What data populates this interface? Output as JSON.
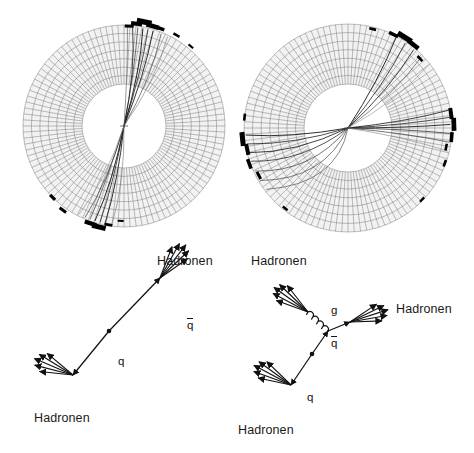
{
  "figure": {
    "type": "particle-physics-event-display",
    "background": "#ffffff",
    "ink": "#111111"
  },
  "detectors": [
    {
      "id": "detector-left",
      "name": "two-jet-event",
      "jet_count": 2,
      "center": [
        124,
        126
      ],
      "inner_radius": 42,
      "outer_radius": 101,
      "ring_cells": 104,
      "ring_rows": 7,
      "grid_color": "#6a6a6a",
      "cell_fill": "#f2f2f2",
      "tracks": [
        {
          "angle_deg": -73,
          "curve": 5,
          "width": 0.9,
          "shade": "#1a1a1a"
        },
        {
          "angle_deg": -76,
          "curve": 4,
          "width": 0.8,
          "shade": "#222222"
        },
        {
          "angle_deg": -79,
          "curve": 6,
          "width": 0.9,
          "shade": "#111111"
        },
        {
          "angle_deg": -82,
          "curve": 3,
          "width": 0.7,
          "shade": "#333333"
        },
        {
          "angle_deg": -85,
          "curve": 7,
          "width": 0.8,
          "shade": "#1a1a1a"
        },
        {
          "angle_deg": -68,
          "curve": 8,
          "width": 0.7,
          "shade": "#444444"
        },
        {
          "angle_deg": -64,
          "curve": 9,
          "width": 0.6,
          "shade": "#777777"
        },
        {
          "angle_deg": -88,
          "curve": 2,
          "width": 0.6,
          "shade": "#555555"
        },
        {
          "angle_deg": 101,
          "curve": -5,
          "width": 0.9,
          "shade": "#1a1a1a"
        },
        {
          "angle_deg": 104,
          "curve": -4,
          "width": 0.8,
          "shade": "#222222"
        },
        {
          "angle_deg": 107,
          "curve": -6,
          "width": 0.9,
          "shade": "#111111"
        },
        {
          "angle_deg": 110,
          "curve": -3,
          "width": 0.7,
          "shade": "#333333"
        },
        {
          "angle_deg": 113,
          "curve": -7,
          "width": 0.7,
          "shade": "#3a3a3a"
        },
        {
          "angle_deg": 97,
          "curve": -8,
          "width": 0.6,
          "shade": "#707070"
        },
        {
          "angle_deg": 117,
          "curve": -9,
          "width": 0.6,
          "shade": "#888888"
        }
      ],
      "deposits": [
        {
          "angle_deg": -74,
          "radius": 104,
          "length": 13,
          "thickness": 4.5
        },
        {
          "angle_deg": -79,
          "radius": 106,
          "length": 15,
          "thickness": 5.5
        },
        {
          "angle_deg": -83,
          "radius": 103,
          "length": 11,
          "thickness": 4.0
        },
        {
          "angle_deg": -70,
          "radius": 104,
          "length": 10,
          "thickness": 3.5
        },
        {
          "angle_deg": -87,
          "radius": 100,
          "length": 9,
          "thickness": 3.0
        },
        {
          "angle_deg": -60,
          "radius": 105,
          "length": 7,
          "thickness": 2.5
        },
        {
          "angle_deg": -50,
          "radius": 104,
          "length": 6,
          "thickness": 2.2
        },
        {
          "angle_deg": 104,
          "radius": 104,
          "length": 14,
          "thickness": 5.0
        },
        {
          "angle_deg": 109,
          "radius": 103,
          "length": 12,
          "thickness": 4.2
        },
        {
          "angle_deg": 99,
          "radius": 100,
          "length": 8,
          "thickness": 3.0
        },
        {
          "angle_deg": 126,
          "radius": 104,
          "length": 8,
          "thickness": 3.0
        },
        {
          "angle_deg": 135,
          "radius": 101,
          "length": 7,
          "thickness": 3.2
        },
        {
          "angle_deg": 92,
          "radius": 95,
          "length": 6,
          "thickness": 2.0
        }
      ]
    },
    {
      "id": "detector-right",
      "name": "three-jet-event",
      "jet_count": 3,
      "center": [
        348,
        128
      ],
      "inner_radius": 44,
      "outer_radius": 104,
      "ring_cells": 104,
      "ring_rows": 7,
      "grid_color": "#6a6a6a",
      "cell_fill": "#f2f2f2",
      "tracks": [
        {
          "angle_deg": -2,
          "curve": 2,
          "width": 0.9,
          "shade": "#1a1a1a"
        },
        {
          "angle_deg": -6,
          "curve": 3,
          "width": 0.8,
          "shade": "#222222"
        },
        {
          "angle_deg": -10,
          "curve": 4,
          "width": 0.8,
          "shade": "#111111"
        },
        {
          "angle_deg": 3,
          "curve": -2,
          "width": 0.8,
          "shade": "#333333"
        },
        {
          "angle_deg": 8,
          "curve": -3,
          "width": 0.7,
          "shade": "#3a3a3a"
        },
        {
          "angle_deg": 13,
          "curve": -4,
          "width": 0.6,
          "shade": "#808080"
        },
        {
          "angle_deg": -62,
          "curve": 5,
          "width": 0.9,
          "shade": "#1a1a1a"
        },
        {
          "angle_deg": -56,
          "curve": 6,
          "width": 0.8,
          "shade": "#222222"
        },
        {
          "angle_deg": -50,
          "curve": 7,
          "width": 0.8,
          "shade": "#111111"
        },
        {
          "angle_deg": -44,
          "curve": 8,
          "width": 0.7,
          "shade": "#555555"
        },
        {
          "angle_deg": -38,
          "curve": 9,
          "width": 0.6,
          "shade": "#909090"
        },
        {
          "angle_deg": 176,
          "curve": -6,
          "width": 0.9,
          "shade": "#1a1a1a"
        },
        {
          "angle_deg": 171,
          "curve": -8,
          "width": 0.8,
          "shade": "#222222"
        },
        {
          "angle_deg": 166,
          "curve": -12,
          "width": 0.8,
          "shade": "#111111"
        },
        {
          "angle_deg": 161,
          "curve": -18,
          "width": 0.8,
          "shade": "#2a2a2a"
        },
        {
          "angle_deg": 155,
          "curve": -26,
          "width": 0.7,
          "shade": "#3a3a3a"
        },
        {
          "angle_deg": 149,
          "curve": -34,
          "width": 0.7,
          "shade": "#444444"
        },
        {
          "angle_deg": 143,
          "curve": -42,
          "width": 0.7,
          "shade": "#555555"
        }
      ],
      "deposits": [
        {
          "angle_deg": -58,
          "radius": 107,
          "length": 16,
          "thickness": 5.5
        },
        {
          "angle_deg": -52,
          "radius": 106,
          "length": 13,
          "thickness": 4.5
        },
        {
          "angle_deg": -64,
          "radius": 104,
          "length": 10,
          "thickness": 3.5
        },
        {
          "angle_deg": -44,
          "radius": 100,
          "length": 7,
          "thickness": 2.6
        },
        {
          "angle_deg": -76,
          "radius": 102,
          "length": 7,
          "thickness": 2.6
        },
        {
          "angle_deg": -2,
          "radius": 106,
          "length": 13,
          "thickness": 4.6
        },
        {
          "angle_deg": -8,
          "radius": 104,
          "length": 11,
          "thickness": 4.0
        },
        {
          "angle_deg": 5,
          "radius": 104,
          "length": 10,
          "thickness": 3.6
        },
        {
          "angle_deg": 11,
          "radius": 100,
          "length": 7,
          "thickness": 2.6
        },
        {
          "angle_deg": 20,
          "radius": 103,
          "length": 7,
          "thickness": 2.6
        },
        {
          "angle_deg": 174,
          "radius": 106,
          "length": 14,
          "thickness": 5.0
        },
        {
          "angle_deg": 168,
          "radius": 103,
          "length": 11,
          "thickness": 4.0
        },
        {
          "angle_deg": 160,
          "radius": 105,
          "length": 10,
          "thickness": 3.6
        },
        {
          "angle_deg": 152,
          "radius": 101,
          "length": 8,
          "thickness": 3.0
        },
        {
          "angle_deg": 186,
          "radius": 104,
          "length": 7,
          "thickness": 2.6
        },
        {
          "angle_deg": 128,
          "radius": 102,
          "length": 6,
          "thickness": 2.4
        },
        {
          "angle_deg": 44,
          "radius": 103,
          "length": 6,
          "thickness": 2.4
        }
      ]
    }
  ],
  "schematics": [
    {
      "id": "schematic-left",
      "name": "two-jet-schematic",
      "vertex": [
        109,
        331
      ],
      "labels": {
        "hadrons_upper": "Hadronen",
        "hadrons_lower": "Hadronen",
        "antiquark": "q",
        "antiquark_has_overbar": true,
        "quark": "q"
      },
      "prongs": [
        {
          "name": "antiquark-prong",
          "from": [
            109,
            331
          ],
          "to": [
            160,
            278
          ],
          "label": "q-bar"
        },
        {
          "name": "quark-prong",
          "from": [
            109,
            331
          ],
          "to": [
            73,
            375
          ],
          "label": "q"
        }
      ],
      "jets": [
        {
          "name": "hadron-jet-upper",
          "apex": [
            160,
            278
          ],
          "arrows": 5,
          "center_deg": -52,
          "spread_deg": 34,
          "length": 42
        },
        {
          "name": "hadron-jet-lower",
          "apex": [
            73,
            375
          ],
          "arrows": 5,
          "center_deg": 203,
          "spread_deg": 34,
          "length": 42
        }
      ]
    },
    {
      "id": "schematic-right",
      "name": "three-jet-schematic",
      "vertex": [
        312,
        354
      ],
      "branch": [
        328,
        331
      ],
      "labels": {
        "hadrons_upper_left": "Hadronen",
        "hadrons_right": "Hadronen",
        "hadrons_lower": "Hadronen",
        "gluon": "g",
        "antiquark": "q",
        "antiquark_has_overbar": true,
        "quark": "q"
      },
      "prongs": [
        {
          "name": "quark-prong",
          "from": [
            312,
            354
          ],
          "to": [
            291,
            385
          ],
          "label": "q"
        },
        {
          "name": "antiquark-prong",
          "from": [
            312,
            354
          ],
          "to": [
            328,
            331
          ],
          "label": "q-bar"
        },
        {
          "name": "antiquark-out",
          "from": [
            328,
            331
          ],
          "to": [
            350,
            322
          ],
          "label": "q-bar-out"
        },
        {
          "name": "gluon-prong",
          "from": [
            328,
            331
          ],
          "to": [
            308,
            312
          ],
          "label": "g",
          "style": "coil",
          "coils": 4
        }
      ],
      "jets": [
        {
          "name": "hadron-jet-upper-left",
          "apex": [
            308,
            312
          ],
          "arrows": 5,
          "center_deg": 216,
          "spread_deg": 32,
          "length": 42
        },
        {
          "name": "hadron-jet-right",
          "apex": [
            350,
            322
          ],
          "arrows": 5,
          "center_deg": -18,
          "spread_deg": 32,
          "length": 40
        },
        {
          "name": "hadron-jet-lower-left",
          "apex": [
            291,
            385
          ],
          "arrows": 5,
          "center_deg": 208,
          "spread_deg": 32,
          "length": 42
        }
      ]
    }
  ],
  "text_labels": [
    {
      "name": "label-hadronen-left-upper",
      "text": "Hadronen",
      "x": 157,
      "y": 254
    },
    {
      "name": "label-hadronen-left-lower",
      "text": "Hadronen",
      "x": 34,
      "y": 411
    },
    {
      "name": "label-hadronen-right-upper",
      "text": "Hadronen",
      "x": 251,
      "y": 254
    },
    {
      "name": "label-hadronen-right-side",
      "text": "Hadronen",
      "x": 396,
      "y": 302
    },
    {
      "name": "label-hadronen-right-lower",
      "text": "Hadronen",
      "x": 238,
      "y": 423
    },
    {
      "name": "label-gluon",
      "text": "g",
      "x": 331,
      "y": 304
    },
    {
      "name": "label-antiquark-left",
      "text": "q",
      "x": 187,
      "y": 318
    },
    {
      "name": "label-quark-left",
      "text": "q",
      "x": 118,
      "y": 355
    },
    {
      "name": "label-antiquark-right",
      "text": "q",
      "x": 331,
      "y": 336
    },
    {
      "name": "label-quark-right",
      "text": "q",
      "x": 307,
      "y": 391
    }
  ]
}
